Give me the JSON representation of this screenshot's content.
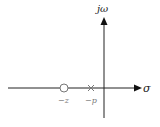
{
  "diagram": {
    "type": "s-plane pole-zero plot",
    "axes": {
      "horizontal_label": "σ",
      "vertical_label": "jω"
    },
    "zero": {
      "symbol": "circle",
      "label": "−z"
    },
    "pole": {
      "symbol": "cross",
      "label": "−p"
    },
    "colors": {
      "axis": "#222222",
      "markers": "#777777"
    }
  }
}
